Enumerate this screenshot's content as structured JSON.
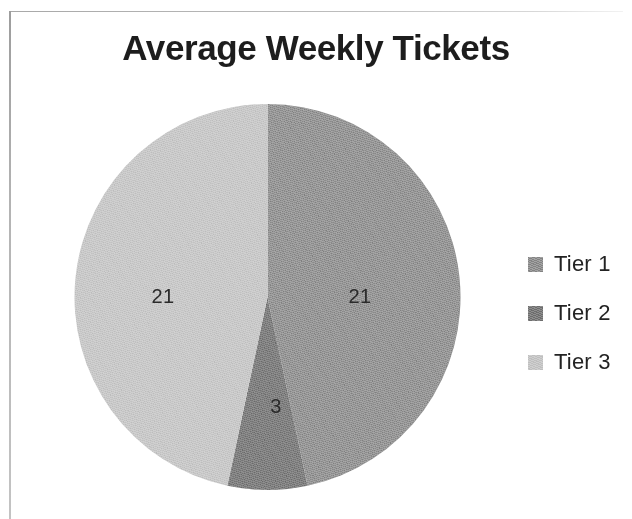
{
  "frame": {
    "border_color": "#b9b9b9",
    "background": "#ffffff"
  },
  "chart_data": {
    "type": "pie",
    "title": "Average Weekly Tickets",
    "xlabel": "",
    "ylabel": "",
    "categories": [
      "Tier 1",
      "Tier 2",
      "Tier 3"
    ],
    "values": [
      21,
      3,
      21
    ],
    "total": 45,
    "data_labels": [
      "21",
      "3",
      "21"
    ],
    "colors": [
      "#8b8b8b",
      "#757575",
      "#c3c3c3"
    ],
    "start_angle_deg": 0,
    "direction": "clockwise",
    "legend_position": "right",
    "grid": false,
    "slices": [
      {
        "name": "Tier 1",
        "value": 21,
        "label": "21",
        "color": "#8b8b8b",
        "start_deg": 0,
        "sweep_deg": 168
      },
      {
        "name": "Tier 2",
        "value": 3,
        "label": "3",
        "color": "#757575",
        "start_deg": 168,
        "sweep_deg": 24
      },
      {
        "name": "Tier 3",
        "value": 21,
        "label": "21",
        "color": "#c3c3c3",
        "start_deg": 192,
        "sweep_deg": 168
      }
    ]
  },
  "legend": {
    "items": [
      {
        "label": "Tier 1",
        "color": "#8b8b8b"
      },
      {
        "label": "Tier 2",
        "color": "#757575"
      },
      {
        "label": "Tier 3",
        "color": "#c3c3c3"
      }
    ]
  }
}
